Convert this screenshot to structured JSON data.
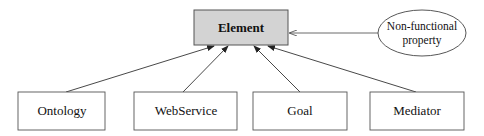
{
  "diagram": {
    "type": "class-hierarchy",
    "root": {
      "label": "Element",
      "fill": "#d3d3d3",
      "stroke": "#555555"
    },
    "property": {
      "label_line1": "Non-functional",
      "label_line2": "property",
      "shape": "ellipse"
    },
    "children": [
      {
        "label": "Ontology"
      },
      {
        "label": "WebService"
      },
      {
        "label": "Goal"
      },
      {
        "label": "Mediator"
      }
    ],
    "edges": [
      {
        "from": "Ontology",
        "to": "Element",
        "arrow": "filled"
      },
      {
        "from": "WebService",
        "to": "Element",
        "arrow": "filled"
      },
      {
        "from": "Goal",
        "to": "Element",
        "arrow": "filled"
      },
      {
        "from": "Mediator",
        "to": "Element",
        "arrow": "filled"
      },
      {
        "from": "Non-functional property",
        "to": "Element",
        "arrow": "open"
      }
    ],
    "colors": {
      "line": "#333333",
      "box_stroke": "#555555",
      "background": "#ffffff"
    }
  }
}
